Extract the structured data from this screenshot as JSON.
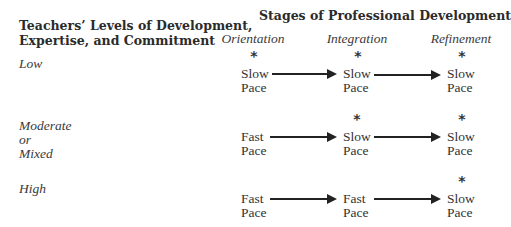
{
  "left_header": {
    "line1": "Teachers’ Levels of Development,",
    "line2": "Expertise, and Commitment"
  },
  "title": "Stages of Professional Development",
  "stages": [
    {
      "label": "Orientation"
    },
    {
      "label": "Integration"
    },
    {
      "label": "Refinement"
    }
  ],
  "rows": [
    {
      "level_lines": [
        "Low"
      ],
      "cells": [
        {
          "pace": "Slow",
          "word": "Pace",
          "asterisk": "*"
        },
        {
          "pace": "Slow",
          "word": "Pace",
          "asterisk": "*"
        },
        {
          "pace": "Slow",
          "word": "Pace",
          "asterisk": "*"
        }
      ]
    },
    {
      "level_lines": [
        "Moderate",
        "or",
        "Mixed"
      ],
      "cells": [
        {
          "pace": "Fast",
          "word": "Pace",
          "asterisk": ""
        },
        {
          "pace": "Slow",
          "word": "Pace",
          "asterisk": "*"
        },
        {
          "pace": "Slow",
          "word": "Pace",
          "asterisk": "*"
        }
      ]
    },
    {
      "level_lines": [
        "High"
      ],
      "cells": [
        {
          "pace": "Fast",
          "word": "Pace",
          "asterisk": ""
        },
        {
          "pace": "Fast",
          "word": "Pace",
          "asterisk": ""
        },
        {
          "pace": "Slow",
          "word": "Pace",
          "asterisk": "*"
        }
      ]
    }
  ]
}
